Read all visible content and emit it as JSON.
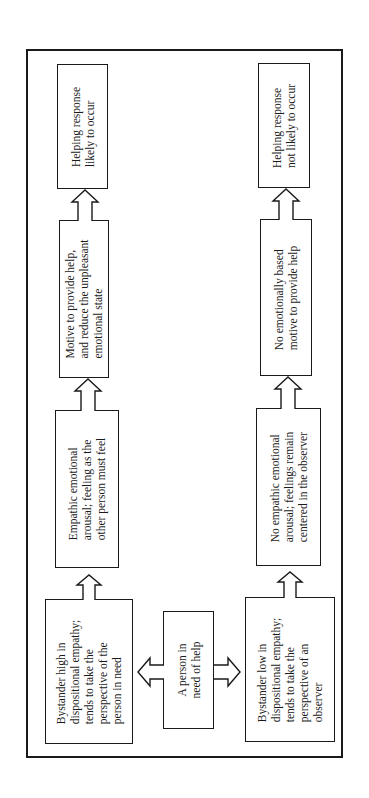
{
  "diagram": {
    "title": "",
    "center": {
      "lines": [
        "A person in",
        "need of help"
      ]
    },
    "high_empathy_path": {
      "bystander": {
        "lines": [
          "Bystander high in",
          "dispositional empathy;",
          "tends to take the",
          "perspective of the",
          "person in need"
        ]
      },
      "arousal": {
        "lines": [
          "Empathic emotional",
          "arousal; feeling as the",
          "other person must feel"
        ]
      },
      "motive": {
        "lines": [
          "Motive to provide help,",
          "and reduce the unpleasant",
          "emotional state"
        ]
      },
      "outcome": {
        "lines": [
          "Helping response",
          "likely to occur"
        ]
      }
    },
    "low_empathy_path": {
      "bystander": {
        "lines": [
          "Bystander low in",
          "dispositional empathy;",
          "tends to take the",
          "perspective of an",
          "observer"
        ]
      },
      "arousal": {
        "lines": [
          "No empathic emotional",
          "arousal; feelings remain",
          "centered in the observer"
        ]
      },
      "motive": {
        "lines": [
          "No emotionally based",
          "motive to provide help"
        ]
      },
      "outcome": {
        "lines": [
          "Helping response",
          "not likely to occur"
        ]
      }
    },
    "orientation": "rotated-90-ccw",
    "colors": {
      "stroke": "#1a1a1a",
      "background": "#ffffff"
    }
  }
}
